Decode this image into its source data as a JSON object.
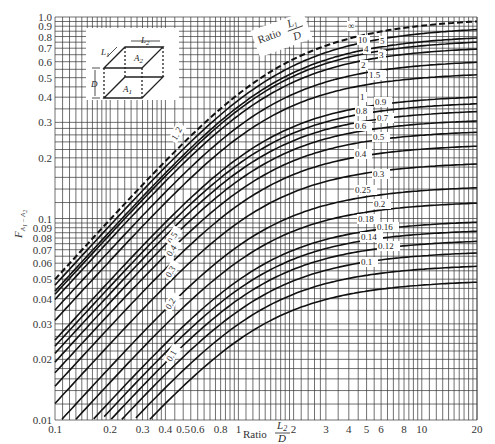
{
  "chart_data": {
    "type": "line",
    "title": "",
    "xlabel": "Ratio L2/D",
    "ylabel": "F A1-A2",
    "xscale": "log",
    "yscale": "log",
    "xlim": [
      0.1,
      20
    ],
    "ylim": [
      0.01,
      1.0
    ],
    "grid": true,
    "x_ticks": [
      "0.1",
      "0.2",
      "0.3",
      "0.4",
      "0.5",
      "0.6",
      "0.8",
      "1",
      "2",
      "3",
      "4",
      "5",
      "6",
      "8",
      "10",
      "20"
    ],
    "y_ticks": [
      "0.01",
      "0.02",
      "0.03",
      "0.04",
      "0.05",
      "0.06",
      "0.07",
      "0.08",
      "0.09",
      "0.1",
      "0.2",
      "0.3",
      "0.4",
      "0.5",
      "0.6",
      "0.7",
      "0.8",
      "0.9",
      "1.0"
    ],
    "parameter_label": "Ratio L1/D",
    "series": [
      {
        "name": "∞",
        "L1_over_D": "inf",
        "dashed": true,
        "values_at_x": {
          "0.1": 0.05,
          "1": 0.41,
          "20": 0.95
        }
      },
      {
        "name": "10",
        "L1_over_D": 10,
        "values_at_x": {
          "0.1": 0.045,
          "1": 0.38,
          "20": 0.83
        }
      },
      {
        "name": "5",
        "L1_over_D": 5,
        "values_at_x": {
          "0.1": 0.044,
          "1": 0.38,
          "20": 0.75
        }
      },
      {
        "name": "4",
        "L1_over_D": 4,
        "values_at_x": {
          "0.1": 0.043,
          "1": 0.37,
          "20": 0.71
        }
      },
      {
        "name": "3",
        "L1_over_D": 3,
        "values_at_x": {
          "0.1": 0.042,
          "1": 0.36,
          "20": 0.65
        }
      },
      {
        "name": "2",
        "L1_over_D": 2,
        "values_at_x": {
          "0.1": 0.04,
          "1": 0.33,
          "20": 0.55
        }
      },
      {
        "name": "1.5",
        "L1_over_D": 1.5,
        "values_at_x": {
          "0.1": 0.037,
          "1": 0.29,
          "20": 0.47
        }
      },
      {
        "name": "1",
        "L1_over_D": 1,
        "values_at_x": {
          "0.1": 0.032,
          "1": 0.2,
          "20": 0.38
        }
      },
      {
        "name": "0.9",
        "L1_over_D": 0.9
      },
      {
        "name": "0.8",
        "L1_over_D": 0.8
      },
      {
        "name": "0.7",
        "L1_over_D": 0.7
      },
      {
        "name": "0.6",
        "L1_over_D": 0.6
      },
      {
        "name": "0.5",
        "L1_over_D": 0.5
      },
      {
        "name": "0.4",
        "L1_over_D": 0.4
      },
      {
        "name": "0.3",
        "L1_over_D": 0.3
      },
      {
        "name": "0.25",
        "L1_over_D": 0.25
      },
      {
        "name": "0.2",
        "L1_over_D": 0.2
      },
      {
        "name": "0.18",
        "L1_over_D": 0.18
      },
      {
        "name": "0.16",
        "L1_over_D": 0.16
      },
      {
        "name": "0.14",
        "L1_over_D": 0.14
      },
      {
        "name": "0.12",
        "L1_over_D": 0.12
      },
      {
        "name": "0.1",
        "L1_over_D": 0.1,
        "values_at_x": {
          "0.1": 0.003,
          "1": 0.03,
          "20": 0.05
        }
      }
    ],
    "curve_labels_right": [
      {
        "text": "∞",
        "x": 348,
        "y": 29
      },
      {
        "text": "10",
        "x": 358,
        "y": 43
      },
      {
        "text": "5",
        "x": 380,
        "y": 44
      },
      {
        "text": "4",
        "x": 364,
        "y": 52
      },
      {
        "text": "3",
        "x": 379,
        "y": 58
      },
      {
        "text": "2",
        "x": 361,
        "y": 68
      },
      {
        "text": "1.5",
        "x": 369,
        "y": 78
      },
      {
        "text": "1",
        "x": 360,
        "y": 100
      },
      {
        "text": "0.9",
        "x": 375,
        "y": 105
      },
      {
        "text": "0.8",
        "x": 356,
        "y": 114
      },
      {
        "text": "0.7",
        "x": 377,
        "y": 121
      },
      {
        "text": "0.6",
        "x": 355,
        "y": 129
      },
      {
        "text": "0.5",
        "x": 373,
        "y": 140
      },
      {
        "text": "0.4",
        "x": 355,
        "y": 157
      },
      {
        "text": "0.3",
        "x": 373,
        "y": 177
      },
      {
        "text": "0.25",
        "x": 355,
        "y": 193
      },
      {
        "text": "0.2",
        "x": 374,
        "y": 207
      },
      {
        "text": "0.18",
        "x": 358,
        "y": 222
      },
      {
        "text": "0.16",
        "x": 377,
        "y": 230
      },
      {
        "text": "0.14",
        "x": 361,
        "y": 240
      },
      {
        "text": "0.12",
        "x": 378,
        "y": 249
      },
      {
        "text": "0.1",
        "x": 361,
        "y": 265
      }
    ],
    "curve_labels_left": [
      {
        "text": "0.5",
        "x": 172,
        "y": 244
      },
      {
        "text": "0.4",
        "x": 171,
        "y": 257
      },
      {
        "text": "0.3",
        "x": 170,
        "y": 278
      },
      {
        "text": "0.2",
        "x": 170,
        "y": 310
      },
      {
        "text": "0.1",
        "x": 171,
        "y": 362
      },
      {
        "text": "1.5",
        "x": 176,
        "y": 141
      },
      {
        "text": "2",
        "x": 180,
        "y": 133
      }
    ],
    "inset": {
      "labels": [
        "L1",
        "L2",
        "A2",
        "A1",
        "D"
      ]
    }
  },
  "labels": {
    "xlabel_prefix": "Ratio",
    "xlabel_num": "L",
    "xlabel_num_sub": "2",
    "xlabel_den": "D",
    "ylabel_main": "F",
    "ylabel_sub": "A1 - A2",
    "ratio_l1_prefix": "Ratio",
    "ratio_l1_num": "L1",
    "ratio_l1_den": "D"
  }
}
